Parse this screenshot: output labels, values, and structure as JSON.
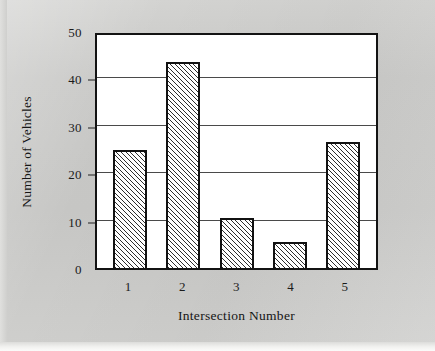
{
  "chart_data": {
    "type": "bar",
    "title": "",
    "xlabel": "Intersection Number",
    "ylabel": "Number of Vehicles",
    "categories": [
      "1",
      "2",
      "3",
      "4",
      "5"
    ],
    "values": [
      25,
      43.5,
      10.5,
      5.5,
      26.5
    ],
    "ylim": [
      0,
      50
    ],
    "y_ticks": [
      "0",
      "10",
      "20",
      "30",
      "40",
      "50"
    ],
    "y_tick_values": [
      0,
      10,
      20,
      30,
      40,
      50
    ],
    "grid": "horizontal",
    "legend": "none",
    "series_name": "Number of Vehicles",
    "bar_style": "diagonal-hatch-white-fill-black-outline"
  },
  "figure": {
    "background_color": "#c8c8c6",
    "plot_background_color": "#ffffff",
    "frame_color": "#131313",
    "gridline_color": "#4a4a4a",
    "bar_outline_color": "#111111",
    "text_color": "#1b1b1b"
  }
}
